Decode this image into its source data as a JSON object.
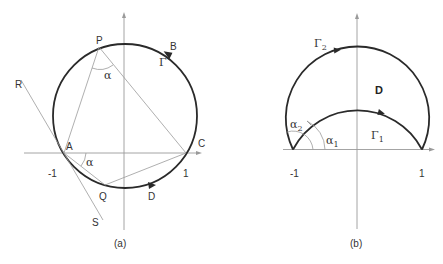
{
  "figure": {
    "panel_a": {
      "caption": "(a)",
      "points": {
        "P": "P",
        "A": "A",
        "Q": "Q",
        "C": "C",
        "B": "B",
        "D": "D",
        "R": "R",
        "S": "S"
      },
      "curve_label": "Γ",
      "angle_label_top": "α",
      "angle_label_bottom": "α",
      "tick_neg": "-1",
      "tick_pos": "1"
    },
    "panel_b": {
      "caption": "(b)",
      "region_label": "D",
      "curve_outer": {
        "symbol": "Γ",
        "sub": "2"
      },
      "curve_inner": {
        "symbol": "Γ",
        "sub": "1"
      },
      "angle_outer": {
        "symbol": "α",
        "sub": "2"
      },
      "angle_inner": {
        "symbol": "α",
        "sub": "1"
      },
      "tick_neg": "-1",
      "tick_pos": "1"
    },
    "colors": {
      "curve": "#2a2a2a",
      "axis": "#9a9a9a",
      "background": "#ffffff"
    }
  }
}
